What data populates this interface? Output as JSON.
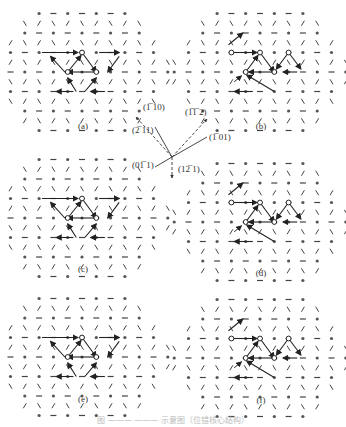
{
  "figure": {
    "panels": [
      {
        "id": "a",
        "label": "(a)",
        "cx": 82,
        "cy": 72,
        "pattern": "triangle"
      },
      {
        "id": "b",
        "label": "(b)",
        "cx": 260,
        "cy": 72,
        "pattern": "zigzag"
      },
      {
        "id": "c",
        "label": "(c)",
        "cx": 82,
        "cy": 218,
        "pattern": "triangle"
      },
      {
        "id": "d",
        "label": "(d)",
        "cx": 260,
        "cy": 222,
        "pattern": "zigzag"
      },
      {
        "id": "e",
        "label": "(e)",
        "cx": 82,
        "cy": 357,
        "pattern": "triangle"
      },
      {
        "id": "f",
        "label": "(f)",
        "cx": 260,
        "cy": 358,
        "pattern": "zigzag"
      }
    ],
    "directions": {
      "origin": [
        172,
        157
      ],
      "vectors": [
        {
          "label": "(̅1 10)",
          "text": "(¯110)",
          "style": "solid",
          "end": [
            155,
            127
          ],
          "tx": 143,
          "ty": 110
        },
        {
          "label": "(¯211)",
          "text": "(¯211)",
          "style": "dashed",
          "end": [
            136,
            117
          ],
          "tx": 132,
          "ty": 133
        },
        {
          "label": "(¯¯112)",
          "text": "(¯¯112)",
          "style": "dashed",
          "end": [
            207,
            119
          ],
          "tx": 185,
          "ty": 115
        },
        {
          "label": "(¯101)",
          "text": "(¯101)",
          "style": "solid",
          "end": [
            207,
            137
          ],
          "tx": 209,
          "ty": 140
        },
        {
          "label": "(0¯11)",
          "text": "(0¯11)",
          "style": "solid",
          "end": [
            155,
            167
          ],
          "tx": 132,
          "ty": 168
        },
        {
          "label": "(1¯21)",
          "text": "(1¯21)",
          "style": "dashed",
          "end": [
            172,
            178
          ],
          "tx": 178,
          "ty": 172
        }
      ],
      "label_texts": {
        "v1": "(1̅ 10)",
        "v2": "(2̅ 11)",
        "v3": "(1̅1̅ 2)",
        "v4": "(1̅ 01)",
        "v5": "(01̅ 1)",
        "v6": "(12̅ 1)"
      }
    },
    "caption": "图 ——— ——— 示意图（位错核心结构）"
  }
}
